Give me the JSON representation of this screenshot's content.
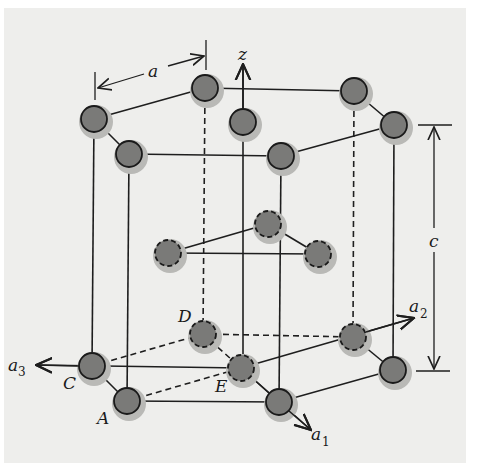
{
  "figure": {
    "background_color": "#eeeeec",
    "atom_fill_color": "#7a7a78"
  },
  "labels": {
    "a": "a",
    "c": "c",
    "z": "z",
    "a1_base": "a",
    "a1_sub": "1",
    "a2_base": "a",
    "a2_sub": "2",
    "a3_base": "a",
    "a3_sub": "3",
    "A": "A",
    "C": "C",
    "D": "D",
    "E": "E"
  },
  "atoms": {
    "top_layer": [
      {
        "id": "top-left-back",
        "x": 94,
        "y": 119
      },
      {
        "id": "top-left-front",
        "x": 129,
        "y": 154
      },
      {
        "id": "top-back-mid",
        "x": 205,
        "y": 88
      },
      {
        "id": "top-right-back",
        "x": 354,
        "y": 91
      },
      {
        "id": "top-right-front",
        "x": 394,
        "y": 125
      },
      {
        "id": "top-front-mid",
        "x": 281,
        "y": 156
      },
      {
        "id": "top-center",
        "x": 243,
        "y": 122
      }
    ],
    "middle_layer": [
      {
        "id": "mid-left",
        "x": 168,
        "y": 253
      },
      {
        "id": "mid-top",
        "x": 268,
        "y": 224
      },
      {
        "id": "mid-right",
        "x": 318,
        "y": 254
      }
    ],
    "bottom_layer": [
      {
        "id": "bottom-C",
        "x": 92,
        "y": 366
      },
      {
        "id": "bottom-A",
        "x": 127,
        "y": 401
      },
      {
        "id": "bottom-D",
        "x": 203,
        "y": 334
      },
      {
        "id": "bottom-right-back",
        "x": 353,
        "y": 337
      },
      {
        "id": "bottom-right-front",
        "x": 393,
        "y": 370
      },
      {
        "id": "bottom-front-mid",
        "x": 279,
        "y": 402
      },
      {
        "id": "bottom-E",
        "x": 241,
        "y": 368
      }
    ]
  }
}
